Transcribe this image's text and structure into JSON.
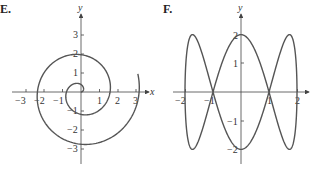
{
  "chart_data": [
    {
      "type": "line",
      "panel_label": "E.",
      "title": "",
      "xlabel": "x",
      "ylabel": "y",
      "x_ticks": [
        -3,
        -2,
        -1,
        1,
        2,
        3
      ],
      "y_ticks": [
        -3,
        -2,
        -1,
        1,
        2,
        3
      ],
      "x_tick_labels": [
        "−3",
        "−2",
        "−1",
        "1",
        "2",
        "3"
      ],
      "y_tick_labels": [
        "−3",
        "−2",
        "−1",
        "1",
        "2",
        "3"
      ],
      "xlim": [
        -3.6,
        3.6
      ],
      "ylim": [
        -4,
        4
      ],
      "grid": false,
      "description": "Spiral starting at origin, r = θ/4, θ from 0 to about 4π+0.3",
      "series": [
        {
          "name": "spiral",
          "points": [
            [
              0,
              0
            ],
            [
              0,
              0.39
            ],
            [
              -0.79,
              0
            ],
            [
              0,
              -1.18
            ],
            [
              1.57,
              0
            ],
            [
              0,
              1.96
            ],
            [
              -2.36,
              0
            ],
            [
              0,
              -2.75
            ],
            [
              3.14,
              0
            ],
            [
              3.1,
              0.9
            ]
          ]
        }
      ]
    },
    {
      "type": "line",
      "panel_label": "F.",
      "title": "",
      "xlabel": "",
      "ylabel": "y",
      "x_ticks": [
        -2,
        -1,
        1,
        2
      ],
      "y_ticks": [
        -2,
        -1,
        1,
        2
      ],
      "x_tick_labels": [
        "−2",
        "−1",
        "1",
        "2"
      ],
      "y_tick_labels": [
        "−2",
        "−1",
        "1",
        "2"
      ],
      "xlim": [
        -2.4,
        2.4
      ],
      "ylim": [
        -2.3,
        2.6
      ],
      "grid": false,
      "description": "Lissajous curve x = 2 sin t, y = 2 cos 3t",
      "series": [
        {
          "name": "lissajous",
          "points": [
            [
              0,
              2
            ],
            [
              1,
              0
            ],
            [
              1.73,
              -2
            ],
            [
              2,
              0
            ],
            [
              1.73,
              2
            ],
            [
              1,
              0
            ],
            [
              0,
              -2
            ],
            [
              -1,
              0
            ],
            [
              -1.73,
              2
            ],
            [
              -2,
              0
            ],
            [
              -1.73,
              -2
            ],
            [
              -1,
              0
            ],
            [
              0,
              2
            ]
          ]
        }
      ]
    }
  ],
  "labels": {
    "e_panel": "E.",
    "f_panel": "F.",
    "e_xaxis": "x",
    "e_yaxis": "y",
    "f_yaxis": "y"
  }
}
